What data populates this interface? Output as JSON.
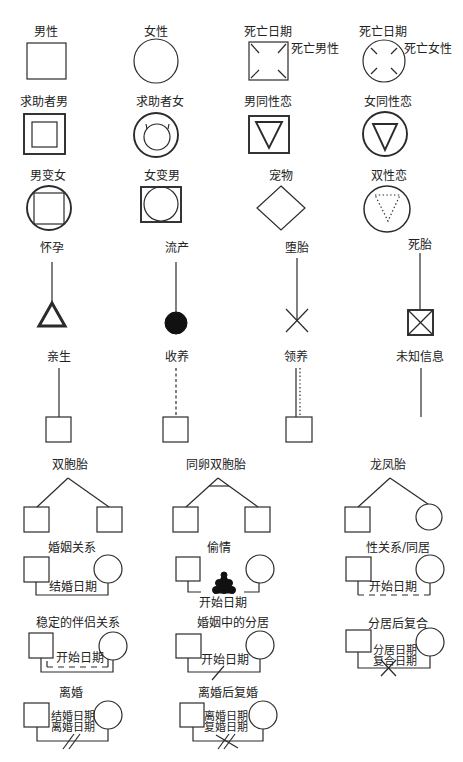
{
  "colors": {
    "stroke": "#2b2b2b",
    "fill": "#111111",
    "background": "#ffffff",
    "text": "#222222"
  },
  "symbols": {
    "male": {
      "label": "男性"
    },
    "female": {
      "label": "女性"
    },
    "deceased_male": {
      "label": "死亡日期",
      "annotation": "死亡男性"
    },
    "deceased_female": {
      "label": "死亡日期",
      "annotation": "死亡女性"
    },
    "client_male": {
      "label": "求助者男"
    },
    "client_female": {
      "label": "求助者女"
    },
    "gay_male": {
      "label": "男同性恋"
    },
    "lesbian": {
      "label": "女同性恋"
    },
    "male_to_female": {
      "label": "男变女"
    },
    "female_to_male": {
      "label": "女变男"
    },
    "pet": {
      "label": "宠物"
    },
    "bisexual": {
      "label": "双性恋"
    },
    "pregnancy": {
      "label": "怀孕"
    },
    "miscarriage": {
      "label": "流产"
    },
    "abortion": {
      "label": "堕胎"
    },
    "stillbirth": {
      "label": "死胎"
    },
    "biological_child": {
      "label": "亲生"
    },
    "foster_child": {
      "label": "收养"
    },
    "adopted_child": {
      "label": "领养"
    },
    "unknown_info": {
      "label": "未知信息"
    },
    "twins": {
      "label": "双胞胎"
    },
    "identical_twins": {
      "label": "同卵双胞胎"
    },
    "fraternal_twins": {
      "label": "龙凤胎"
    }
  },
  "relationships": {
    "marriage": {
      "label": "婚姻关系",
      "dates": [
        "结婚日期"
      ]
    },
    "affair": {
      "label": "偷情",
      "dates": [
        "开始日期"
      ]
    },
    "cohabitation": {
      "label": "性关系/同居",
      "dates": [
        "开始日期"
      ]
    },
    "committed_partnership": {
      "label": "稳定的伴侣关系",
      "dates": [
        "开始日期"
      ]
    },
    "marital_separation": {
      "label": "婚姻中的分居",
      "dates": [
        "开始日期"
      ]
    },
    "reconciliation": {
      "label": "分居后复合",
      "dates": [
        "分居日期",
        "复合日期"
      ]
    },
    "divorce": {
      "label": "离婚",
      "dates": [
        "结婚日期",
        "离婚日期"
      ]
    },
    "remarriage": {
      "label": "离婚后复婚",
      "dates": [
        "离婚日期",
        "复婚日期"
      ]
    }
  }
}
